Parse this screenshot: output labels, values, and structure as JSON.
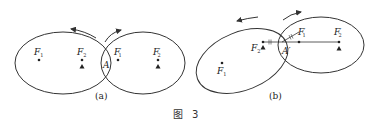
{
  "figure": {
    "caption_prefix": "图",
    "caption_number": "3"
  },
  "subfigures": [
    {
      "id": "a",
      "label": "(a)",
      "left_ellipse": {
        "foci": [
          {
            "name": "F",
            "sub": "1",
            "prime": ""
          },
          {
            "name": "F",
            "sub": "2",
            "prime": ""
          }
        ]
      },
      "right_ellipse": {
        "foci": [
          {
            "name": "F",
            "sub": "1",
            "prime": "′"
          },
          {
            "name": "F",
            "sub": "2",
            "prime": "′"
          }
        ]
      },
      "tangent_point": "A",
      "arrows": [
        "counterclockwise-left",
        "clockwise-right"
      ]
    },
    {
      "id": "b",
      "label": "(b)",
      "left_ellipse": {
        "foci": [
          {
            "name": "F",
            "sub": "1",
            "prime": ""
          },
          {
            "name": "F",
            "sub": "2",
            "prime": ""
          }
        ]
      },
      "right_ellipse": {
        "foci": [
          {
            "name": "F",
            "sub": "1",
            "prime": "′"
          },
          {
            "name": "F",
            "sub": "2",
            "prime": "′"
          }
        ]
      },
      "tangent_point": "A′",
      "arrows": [
        "counterclockwise-left",
        "clockwise-right"
      ]
    }
  ],
  "colors": {
    "stroke": "#333333",
    "text": "#222222",
    "background": "#ffffff"
  }
}
